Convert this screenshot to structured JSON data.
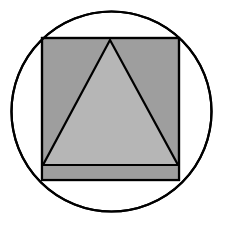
{
  "document": {
    "title": "Geometric Figure",
    "background_color": "#ffffff",
    "width": 225,
    "height": 225
  },
  "figure": {
    "name": "triangle-inscribed-in-square-inscribed-in-circle",
    "stroke_color": "#000000",
    "stroke_width": 2,
    "shapes": {
      "circle": {
        "label": "circle",
        "cx": 111.5,
        "cy": 111.5,
        "r": 100,
        "fill": "none",
        "stroke": "#000000",
        "stroke_width": 2.2
      },
      "square": {
        "label": "square",
        "x": 42,
        "y": 38,
        "width": 137,
        "height": 142,
        "fill": "#9e9e9e",
        "stroke": "#000000",
        "stroke_width": 2.2
      },
      "triangle": {
        "label": "triangle",
        "points": "110,40 178,165 43,165",
        "apex_x": 110,
        "apex_y": 40,
        "base_left_x": 43,
        "base_left_y": 165,
        "base_right_x": 178,
        "base_right_y": 165,
        "fill": "#b6b6b6",
        "stroke": "#000000",
        "stroke_width": 2.2
      },
      "base_band": {
        "label": "base-band",
        "x": 42,
        "y": 165,
        "width": 137,
        "height": 15,
        "fill": "#9e9e9e",
        "stroke": "none"
      },
      "base_line": {
        "label": "triangle-base-line",
        "x1": 42,
        "y1": 165,
        "x2": 179,
        "y2": 165,
        "stroke": "#000000",
        "stroke_width": 2.2
      }
    }
  }
}
